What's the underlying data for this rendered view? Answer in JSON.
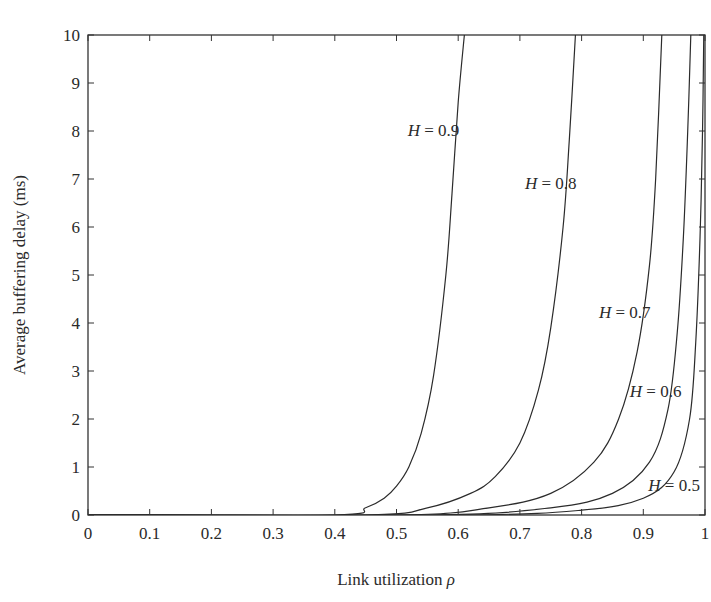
{
  "chart_data": {
    "type": "line",
    "title": "",
    "xlabel": "Link utilization ρ",
    "ylabel": "Average buffering delay (ms)",
    "xlim": [
      0,
      1
    ],
    "ylim": [
      0,
      10
    ],
    "grid": false,
    "legend": "inline curve labels",
    "x_ticks": [
      "0",
      "0.1",
      "0.2",
      "0.3",
      "0.4",
      "0.5",
      "0.6",
      "0.7",
      "0.8",
      "0.9",
      "1"
    ],
    "y_ticks": [
      "0",
      "1",
      "2",
      "3",
      "4",
      "5",
      "6",
      "7",
      "8",
      "9",
      "10"
    ],
    "series": [
      {
        "name": "H = 0.9",
        "x": [
          0.4,
          0.45,
          0.48,
          0.5,
          0.52,
          0.54,
          0.56,
          0.58,
          0.59,
          0.6,
          0.61
        ],
        "y": [
          0.0,
          0.15,
          0.35,
          0.6,
          1.0,
          1.7,
          2.9,
          5.0,
          6.7,
          8.6,
          10.0
        ]
      },
      {
        "name": "H = 0.8",
        "x": [
          0.45,
          0.55,
          0.62,
          0.66,
          0.7,
          0.73,
          0.75,
          0.77,
          0.78,
          0.79
        ],
        "y": [
          0.0,
          0.15,
          0.45,
          0.8,
          1.5,
          2.6,
          3.9,
          6.0,
          7.8,
          10.0
        ]
      },
      {
        "name": "H = 0.7",
        "x": [
          0.5,
          0.65,
          0.75,
          0.82,
          0.86,
          0.89,
          0.91,
          0.92,
          0.93
        ],
        "y": [
          0.0,
          0.15,
          0.45,
          1.1,
          2.0,
          3.4,
          5.2,
          7.0,
          10.0
        ]
      },
      {
        "name": "H = 0.6",
        "x": [
          0.55,
          0.75,
          0.85,
          0.91,
          0.94,
          0.955,
          0.965,
          0.972,
          0.977
        ],
        "y": [
          0.0,
          0.15,
          0.45,
          1.1,
          2.2,
          3.8,
          5.8,
          8.0,
          10.0
        ]
      },
      {
        "name": "H = 0.5",
        "x": [
          0.6,
          0.8,
          0.9,
          0.95,
          0.975,
          0.985,
          0.992,
          0.996,
          0.998
        ],
        "y": [
          0.0,
          0.1,
          0.35,
          0.9,
          2.0,
          3.6,
          5.8,
          8.0,
          10.0
        ]
      }
    ],
    "annotations": [
      {
        "text": "H = 0.9",
        "x": 0.56,
        "y": 7.9
      },
      {
        "text": "H = 0.8",
        "x": 0.75,
        "y": 6.8
      },
      {
        "text": "H = 0.7",
        "x": 0.87,
        "y": 4.1
      },
      {
        "text": "H = 0.6",
        "x": 0.92,
        "y": 2.45
      },
      {
        "text": "H = 0.5",
        "x": 0.95,
        "y": 0.5
      }
    ]
  },
  "labels": {
    "xlabel_main": "Link utilization ",
    "xlabel_symbol": "ρ",
    "ylabel": "Average buffering delay (ms)",
    "curve_prefix": "H",
    "curve_eq": " = ",
    "curves": [
      "0.9",
      "0.8",
      "0.7",
      "0.6",
      "0.5"
    ]
  },
  "colors": {
    "axis": "#333333",
    "curve": "#2b2b2b",
    "text": "#2a2a2a",
    "background": "#ffffff"
  }
}
